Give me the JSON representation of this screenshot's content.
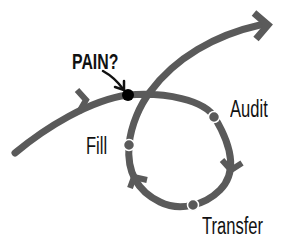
{
  "diagram": {
    "colors": {
      "path": "#5a5a5a",
      "node": "#5a5a5a",
      "pain_point": "#000000",
      "text": "#111111",
      "background": "#ffffff"
    },
    "labels": {
      "pain": "PAIN?",
      "audit": "Audit",
      "fill": "Fill",
      "transfer": "Transfer"
    },
    "nodes": [
      {
        "name": "pain-point",
        "x": 128,
        "y": 95,
        "r": 6
      },
      {
        "name": "audit",
        "x": 214,
        "y": 117,
        "r": 5
      },
      {
        "name": "fill",
        "x": 129,
        "y": 145,
        "r": 5
      },
      {
        "name": "transfer",
        "x": 193,
        "y": 205,
        "r": 5
      }
    ]
  }
}
